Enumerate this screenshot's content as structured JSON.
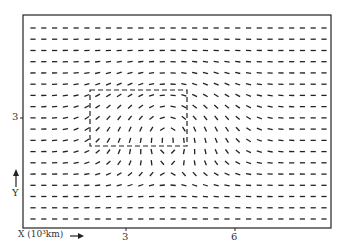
{
  "chart_data": {
    "type": "vector-field",
    "title": "",
    "xlabel": "X (10³km)",
    "ylabel": "Y",
    "x_ticks": [
      "3",
      "6"
    ],
    "y_ticks": [
      "3"
    ],
    "grid": {
      "cols": 28,
      "rows": 18
    },
    "frame": {
      "left": 23,
      "top": 15,
      "right": 331,
      "bottom": 228
    },
    "vortex": {
      "center_col": 12.5,
      "center_row": 8.5,
      "description": "clockwise rotation around dashed box region"
    },
    "dashed_box": {
      "col_start": 8.5,
      "col_end": 16.5,
      "row_start": 6,
      "row_end": 11.5
    },
    "background_flow": "westerly / horizontal",
    "colors": {
      "ink": "#222222",
      "background": "#ffffff"
    }
  },
  "labels": {
    "x_axis": "X (10³km)",
    "x_tick_3": "3",
    "x_tick_6": "6",
    "y_tick_3": "3",
    "y_axis": "Y"
  }
}
